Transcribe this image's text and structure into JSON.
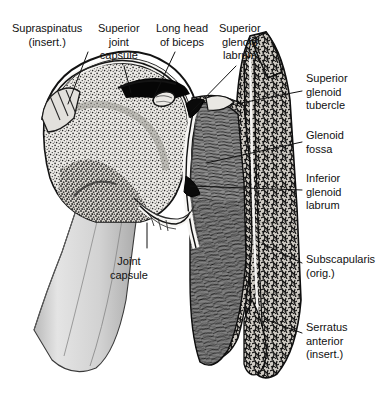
{
  "figure": {
    "view": "anterior coronal cross-section",
    "background_color": "#ffffff",
    "ink_color": "#111111"
  },
  "palette": {
    "bone_cortex": "#1a1a1a",
    "cancellous_bone_fill": "#e8e6e2",
    "humeral_shaft": "#d9d9d9",
    "cartilage": "#f2f1ee",
    "muscle_subscapularis": "#8a8a8a",
    "muscle_dark_fiber": "#2b2b2b",
    "joint_cavity": "#000000",
    "labrum": "#111111",
    "leader_line": "#111111"
  },
  "labels": [
    {
      "id": "supraspinatus",
      "text": "Supraspinatus\n(insert.)",
      "align": "center",
      "x": 12,
      "y": 22,
      "leader": {
        "x1": 88,
        "y1": 52,
        "x2": 68,
        "y2": 104
      }
    },
    {
      "id": "superior-joint-capsule",
      "text": "Superior\njoint\ncapsule",
      "align": "center",
      "x": 98,
      "y": 22,
      "leader": {
        "x1": 124,
        "y1": 66,
        "x2": 131,
        "y2": 93
      }
    },
    {
      "id": "long-head-of-biceps",
      "text": "Long head\nof biceps",
      "align": "center",
      "x": 156,
      "y": 22,
      "leader": {
        "x1": 175,
        "y1": 52,
        "x2": 153,
        "y2": 99
      }
    },
    {
      "id": "superior-glenoid-labrum",
      "text": "Superior\nglenoid\nlabrum",
      "align": "center",
      "x": 219,
      "y": 22,
      "leader": {
        "x1": 236,
        "y1": 66,
        "x2": 191,
        "y2": 112
      }
    },
    {
      "id": "superior-glenoid-tubercle",
      "text": "Superior\nglenoid\ntubercle",
      "align": "left",
      "x": 306,
      "y": 72,
      "leader": {
        "x1": 302,
        "y1": 91,
        "x2": 231,
        "y2": 105
      }
    },
    {
      "id": "glenoid-fossa",
      "text": "Glenoid\nfossa",
      "align": "left",
      "x": 306,
      "y": 129,
      "leader": {
        "x1": 302,
        "y1": 142,
        "x2": 206,
        "y2": 163
      }
    },
    {
      "id": "inferior-glenoid-labrum",
      "text": "Inferior\nglenoid\nlabrum",
      "align": "left",
      "x": 306,
      "y": 172,
      "leader": {
        "x1": 302,
        "y1": 190,
        "x2": 190,
        "y2": 186
      }
    },
    {
      "id": "subscapularis",
      "text": "Subscapularis\n(orig.)",
      "align": "left",
      "x": 306,
      "y": 253,
      "leader": {
        "x1": 302,
        "y1": 263,
        "x2": 262,
        "y2": 243
      }
    },
    {
      "id": "serratus-anterior",
      "text": "Serratus\nanterior\n(insert.)",
      "align": "left",
      "x": 306,
      "y": 321,
      "leader": {
        "x1": 302,
        "y1": 333,
        "x2": 264,
        "y2": 319
      }
    },
    {
      "id": "joint-capsule",
      "text": "Joint\ncapsule",
      "align": "center",
      "x": 110,
      "y": 255,
      "leader": {
        "x1": 147,
        "y1": 248,
        "x2": 147,
        "y2": 223
      }
    }
  ]
}
